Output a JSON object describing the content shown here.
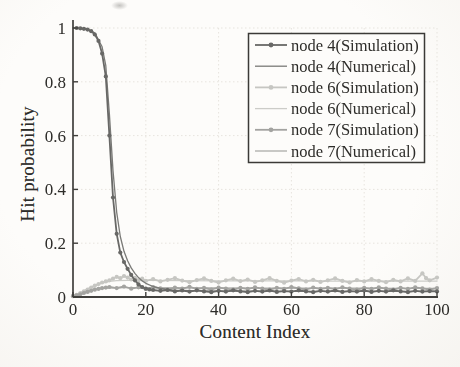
{
  "figure": {
    "xlabel": "Content Index",
    "ylabel": "Hit probability",
    "paper_color": "#fdfcfa",
    "axis_color": "#403f3c",
    "grid_color": "#e7e4de",
    "text_color": "#2d2c29"
  },
  "chart_data": {
    "type": "line",
    "title": "",
    "xlabel": "Content Index",
    "ylabel": "Hit probability",
    "xlim": [
      0,
      100
    ],
    "ylim": [
      0,
      1
    ],
    "xticks": [
      0,
      20,
      40,
      60,
      80,
      100
    ],
    "yticks": [
      0,
      0.2,
      0.4,
      0.6,
      0.8,
      1
    ],
    "grid": true,
    "legend_position": "upper right",
    "series": [
      {
        "id": "node4-simulation",
        "name": "node 4(Simulation)",
        "color": "#686866",
        "marker": "circle",
        "width": 1.8,
        "zorder": 6,
        "points": [
          [
            1,
            1.0
          ],
          [
            2,
            0.999
          ],
          [
            3,
            0.997
          ],
          [
            4,
            0.994
          ],
          [
            5,
            0.988
          ],
          [
            6,
            0.976
          ],
          [
            7,
            0.952
          ],
          [
            8,
            0.905
          ],
          [
            9,
            0.82
          ],
          [
            10,
            0.6
          ],
          [
            11,
            0.37
          ],
          [
            12,
            0.235
          ],
          [
            13,
            0.165
          ],
          [
            14,
            0.13
          ],
          [
            15,
            0.105
          ],
          [
            16,
            0.082
          ],
          [
            17,
            0.062
          ],
          [
            18,
            0.047
          ],
          [
            19,
            0.037
          ],
          [
            20,
            0.031
          ],
          [
            21,
            0.028
          ],
          [
            22,
            0.026
          ],
          [
            24,
            0.023
          ],
          [
            26,
            0.026
          ],
          [
            28,
            0.021
          ],
          [
            30,
            0.024
          ],
          [
            32,
            0.02
          ],
          [
            34,
            0.025
          ],
          [
            36,
            0.021
          ],
          [
            38,
            0.018
          ],
          [
            40,
            0.023
          ],
          [
            42,
            0.02
          ],
          [
            44,
            0.025
          ],
          [
            46,
            0.021
          ],
          [
            48,
            0.018
          ],
          [
            50,
            0.023
          ],
          [
            52,
            0.02
          ],
          [
            54,
            0.024
          ],
          [
            56,
            0.019
          ],
          [
            58,
            0.022
          ],
          [
            60,
            0.02
          ],
          [
            62,
            0.025
          ],
          [
            64,
            0.021
          ],
          [
            66,
            0.018
          ],
          [
            68,
            0.023
          ],
          [
            70,
            0.02
          ],
          [
            72,
            0.024
          ],
          [
            74,
            0.019
          ],
          [
            76,
            0.022
          ],
          [
            78,
            0.02
          ],
          [
            80,
            0.024
          ],
          [
            82,
            0.019
          ],
          [
            84,
            0.023
          ],
          [
            86,
            0.02
          ],
          [
            88,
            0.025
          ],
          [
            90,
            0.021
          ],
          [
            92,
            0.018
          ],
          [
            94,
            0.023
          ],
          [
            96,
            0.02
          ],
          [
            98,
            0.022
          ],
          [
            100,
            0.021
          ]
        ]
      },
      {
        "id": "node4-numerical",
        "name": "node 4(Numerical)",
        "color": "#7a7a77",
        "marker": null,
        "width": 1.3,
        "zorder": 5,
        "points": [
          [
            0,
            1.0
          ],
          [
            2,
            0.999
          ],
          [
            4,
            0.995
          ],
          [
            6,
            0.982
          ],
          [
            8,
            0.93
          ],
          [
            9,
            0.86
          ],
          [
            10,
            0.68
          ],
          [
            11,
            0.47
          ],
          [
            12,
            0.315
          ],
          [
            13,
            0.225
          ],
          [
            14,
            0.17
          ],
          [
            15,
            0.135
          ],
          [
            16,
            0.108
          ],
          [
            17,
            0.088
          ],
          [
            18,
            0.072
          ],
          [
            19,
            0.06
          ],
          [
            20,
            0.051
          ],
          [
            22,
            0.039
          ],
          [
            24,
            0.032
          ],
          [
            26,
            0.028
          ],
          [
            28,
            0.025
          ],
          [
            30,
            0.024
          ],
          [
            35,
            0.023
          ],
          [
            40,
            0.022
          ],
          [
            50,
            0.022
          ],
          [
            60,
            0.021
          ],
          [
            70,
            0.021
          ],
          [
            80,
            0.021
          ],
          [
            90,
            0.021
          ],
          [
            100,
            0.021
          ]
        ]
      },
      {
        "id": "node6-simulation",
        "name": "node 6(Simulation)",
        "color": "#c6c6c2",
        "marker": "circle",
        "width": 1.8,
        "zorder": 2,
        "points": [
          [
            0,
            0.004
          ],
          [
            1,
            0.008
          ],
          [
            2,
            0.014
          ],
          [
            3,
            0.021
          ],
          [
            4,
            0.028
          ],
          [
            5,
            0.035
          ],
          [
            6,
            0.042
          ],
          [
            7,
            0.048
          ],
          [
            8,
            0.054
          ],
          [
            9,
            0.058
          ],
          [
            10,
            0.062
          ],
          [
            11,
            0.068
          ],
          [
            12,
            0.075
          ],
          [
            13,
            0.07
          ],
          [
            14,
            0.078
          ],
          [
            15,
            0.072
          ],
          [
            16,
            0.065
          ],
          [
            17,
            0.071
          ],
          [
            18,
            0.062
          ],
          [
            19,
            0.068
          ],
          [
            20,
            0.06
          ],
          [
            22,
            0.066
          ],
          [
            24,
            0.058
          ],
          [
            26,
            0.064
          ],
          [
            28,
            0.07
          ],
          [
            30,
            0.061
          ],
          [
            32,
            0.055
          ],
          [
            34,
            0.063
          ],
          [
            36,
            0.069
          ],
          [
            38,
            0.06
          ],
          [
            40,
            0.054
          ],
          [
            42,
            0.062
          ],
          [
            44,
            0.068
          ],
          [
            46,
            0.059
          ],
          [
            48,
            0.065
          ],
          [
            50,
            0.056
          ],
          [
            52,
            0.062
          ],
          [
            54,
            0.07
          ],
          [
            56,
            0.06
          ],
          [
            58,
            0.053
          ],
          [
            60,
            0.061
          ],
          [
            62,
            0.067
          ],
          [
            64,
            0.058
          ],
          [
            66,
            0.064
          ],
          [
            68,
            0.056
          ],
          [
            70,
            0.062
          ],
          [
            72,
            0.069
          ],
          [
            74,
            0.06
          ],
          [
            76,
            0.054
          ],
          [
            78,
            0.063
          ],
          [
            80,
            0.058
          ],
          [
            82,
            0.066
          ],
          [
            84,
            0.06
          ],
          [
            86,
            0.055
          ],
          [
            88,
            0.064
          ],
          [
            90,
            0.058
          ],
          [
            92,
            0.069
          ],
          [
            94,
            0.06
          ],
          [
            96,
            0.088
          ],
          [
            97,
            0.07
          ],
          [
            98,
            0.062
          ],
          [
            100,
            0.072
          ]
        ]
      },
      {
        "id": "node6-numerical",
        "name": "node 6(Numerical)",
        "color": "#ccccc8",
        "marker": null,
        "width": 1.3,
        "zorder": 1,
        "points": [
          [
            0,
            0.005
          ],
          [
            2,
            0.016
          ],
          [
            4,
            0.03
          ],
          [
            6,
            0.043
          ],
          [
            8,
            0.052
          ],
          [
            10,
            0.058
          ],
          [
            12,
            0.061
          ],
          [
            15,
            0.062
          ],
          [
            20,
            0.062
          ],
          [
            30,
            0.061
          ],
          [
            40,
            0.06
          ],
          [
            50,
            0.06
          ],
          [
            60,
            0.06
          ],
          [
            70,
            0.059
          ],
          [
            80,
            0.059
          ],
          [
            90,
            0.059
          ],
          [
            100,
            0.059
          ]
        ]
      },
      {
        "id": "node7-simulation",
        "name": "node 7(Simulation)",
        "color": "#a3a3a0",
        "marker": "circle",
        "width": 1.8,
        "zorder": 4,
        "points": [
          [
            0,
            0.003
          ],
          [
            1,
            0.006
          ],
          [
            2,
            0.01
          ],
          [
            3,
            0.015
          ],
          [
            4,
            0.019
          ],
          [
            5,
            0.023
          ],
          [
            6,
            0.027
          ],
          [
            7,
            0.03
          ],
          [
            8,
            0.033
          ],
          [
            9,
            0.035
          ],
          [
            10,
            0.037
          ],
          [
            12,
            0.033
          ],
          [
            14,
            0.039
          ],
          [
            16,
            0.031
          ],
          [
            18,
            0.036
          ],
          [
            20,
            0.03
          ],
          [
            22,
            0.037
          ],
          [
            24,
            0.032
          ],
          [
            26,
            0.028
          ],
          [
            28,
            0.035
          ],
          [
            30,
            0.031
          ],
          [
            32,
            0.038
          ],
          [
            34,
            0.03
          ],
          [
            36,
            0.034
          ],
          [
            38,
            0.028
          ],
          [
            40,
            0.035
          ],
          [
            42,
            0.031
          ],
          [
            44,
            0.027
          ],
          [
            46,
            0.034
          ],
          [
            48,
            0.03
          ],
          [
            50,
            0.036
          ],
          [
            52,
            0.031
          ],
          [
            54,
            0.028
          ],
          [
            56,
            0.034
          ],
          [
            58,
            0.03
          ],
          [
            60,
            0.037
          ],
          [
            62,
            0.032
          ],
          [
            64,
            0.028
          ],
          [
            66,
            0.035
          ],
          [
            68,
            0.03
          ],
          [
            70,
            0.034
          ],
          [
            72,
            0.029
          ],
          [
            74,
            0.036
          ],
          [
            76,
            0.031
          ],
          [
            78,
            0.027
          ],
          [
            80,
            0.034
          ],
          [
            82,
            0.03
          ],
          [
            84,
            0.036
          ],
          [
            86,
            0.031
          ],
          [
            88,
            0.028
          ],
          [
            90,
            0.034
          ],
          [
            92,
            0.03
          ],
          [
            94,
            0.036
          ],
          [
            96,
            0.032
          ],
          [
            98,
            0.028
          ],
          [
            100,
            0.033
          ]
        ]
      },
      {
        "id": "node7-numerical",
        "name": "node 7(Numerical)",
        "color": "#acaca9",
        "marker": null,
        "width": 1.3,
        "zorder": 3,
        "points": [
          [
            0,
            0.003
          ],
          [
            2,
            0.012
          ],
          [
            4,
            0.021
          ],
          [
            6,
            0.028
          ],
          [
            8,
            0.032
          ],
          [
            10,
            0.034
          ],
          [
            15,
            0.035
          ],
          [
            20,
            0.035
          ],
          [
            30,
            0.034
          ],
          [
            40,
            0.034
          ],
          [
            50,
            0.033
          ],
          [
            60,
            0.033
          ],
          [
            70,
            0.033
          ],
          [
            80,
            0.033
          ],
          [
            90,
            0.032
          ],
          [
            100,
            0.032
          ]
        ]
      }
    ]
  }
}
